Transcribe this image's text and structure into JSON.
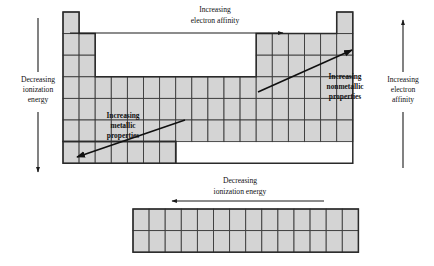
{
  "figure": {
    "type": "diagram",
    "background_color": "#ffffff",
    "cell_fill_color": "#d4d4d4",
    "cell_stroke_color": "#3b3b3b",
    "line_color": "#101010"
  },
  "labels": {
    "left_axis": {
      "line1": "Decreasing",
      "line2": "ionization",
      "line3": "energy",
      "arrow_direction": "down"
    },
    "right_axis": {
      "line1": "Increasing",
      "line2": "electron",
      "line3": "affinity",
      "arrow_direction": "up"
    },
    "top_axis": {
      "line1": "Increasing",
      "line2": "electron affinity",
      "arrow_direction": "right"
    },
    "bottom_axis": {
      "line1": "Decreasing",
      "line2": "ionization energy",
      "arrow_direction": "left"
    },
    "metallic_trend": {
      "line1": "Increasing",
      "line2": "metallic",
      "line3": "properties",
      "arrow_direction": "down-left"
    },
    "nonmetallic_trend": {
      "line1": "Increasing",
      "line2": "nonmetallic",
      "line3": "properties",
      "arrow_direction": "up-right"
    }
  },
  "grid": {
    "cell_width": 16.1,
    "cell_height": 21.6,
    "main_origin_x": 63,
    "main_origin_y": 12,
    "fblock_origin_x": 133,
    "fblock_origin_y": 209,
    "fblock_columns": 14,
    "fblock_rows": 2,
    "rows": [
      {
        "period": 1,
        "segments": [
          {
            "start_group": 1,
            "count": 1
          },
          {
            "start_group": 18,
            "count": 1
          }
        ]
      },
      {
        "period": 2,
        "segments": [
          {
            "start_group": 1,
            "count": 2
          },
          {
            "start_group": 13,
            "count": 6
          }
        ]
      },
      {
        "period": 3,
        "segments": [
          {
            "start_group": 1,
            "count": 2
          },
          {
            "start_group": 13,
            "count": 6
          }
        ]
      },
      {
        "period": 4,
        "segments": [
          {
            "start_group": 1,
            "count": 18
          }
        ]
      },
      {
        "period": 5,
        "segments": [
          {
            "start_group": 1,
            "count": 18
          }
        ]
      },
      {
        "period": 6,
        "segments": [
          {
            "start_group": 1,
            "count": 18
          }
        ]
      },
      {
        "period": 7,
        "segments": [
          {
            "start_group": 1,
            "count": 7
          }
        ]
      }
    ]
  }
}
